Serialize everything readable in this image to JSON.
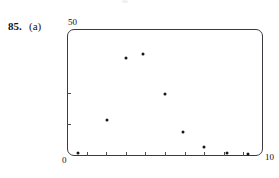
{
  "figure": {
    "exercise_number": "85.",
    "part_label": "(a)",
    "axis_labels": {
      "y_max": "50",
      "y_min": "0",
      "x_max": "10"
    }
  },
  "chart_data": {
    "type": "scatter",
    "title": "",
    "subtitle": "",
    "xlabel": "",
    "ylabel": "",
    "xlim": [
      0,
      10
    ],
    "ylim": [
      0,
      50
    ],
    "grid": false,
    "legend": null,
    "x_ticks": [
      0,
      1,
      2,
      3,
      4,
      5,
      6,
      7,
      8,
      9,
      10
    ],
    "x_tick_labels": [
      "0",
      "",
      "",
      "",
      "",
      "",
      "",
      "",
      "",
      "",
      "10"
    ],
    "y_ticks": [
      0,
      12.5,
      25,
      50
    ],
    "y_tick_labels": [
      "0",
      "",
      "",
      "50"
    ],
    "marker": "dot",
    "marker_color": "#17171b",
    "series": [
      {
        "name": "data",
        "points": [
          {
            "x": 0.55,
            "y": 1.2
          },
          {
            "x": 2.05,
            "y": 14.0
          },
          {
            "x": 3.0,
            "y": 38.5
          },
          {
            "x": 3.9,
            "y": 40.2
          },
          {
            "x": 5.0,
            "y": 24.5
          },
          {
            "x": 5.9,
            "y": 9.5
          },
          {
            "x": 7.0,
            "y": 3.5
          },
          {
            "x": 8.15,
            "y": 1.0
          },
          {
            "x": 9.25,
            "y": 0.6
          }
        ]
      }
    ]
  }
}
